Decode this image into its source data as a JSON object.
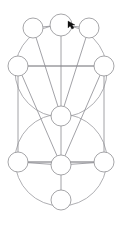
{
  "diagram": {
    "background_color": "#ffffff",
    "stroke_color": "#8a8a90",
    "node_fill": "#ffffff",
    "cursor_color": "#101010",
    "node_radius": 10,
    "nodes": [
      {
        "id": "n1",
        "label": "",
        "name": "node-top-left",
        "cx": 33,
        "cy": 28
      },
      {
        "id": "n2",
        "label": "",
        "name": "node-top-center",
        "cx": 61,
        "cy": 25
      },
      {
        "id": "n3",
        "label": "",
        "name": "node-top-right",
        "cx": 89,
        "cy": 28
      },
      {
        "id": "n4",
        "label": "",
        "name": "node-upper-left",
        "cx": 18,
        "cy": 66
      },
      {
        "id": "n5",
        "label": "",
        "name": "node-upper-right",
        "cx": 104,
        "cy": 66
      },
      {
        "id": "n6",
        "label": "",
        "name": "node-center",
        "cx": 61,
        "cy": 116
      },
      {
        "id": "n7",
        "label": "",
        "name": "node-lower-left",
        "cx": 18,
        "cy": 162
      },
      {
        "id": "n8",
        "label": "",
        "name": "node-lower-center",
        "cx": 61,
        "cy": 165
      },
      {
        "id": "n9",
        "label": "",
        "name": "node-lower-right",
        "cx": 104,
        "cy": 162
      },
      {
        "id": "n10",
        "label": "",
        "name": "node-bottom",
        "cx": 61,
        "cy": 200
      }
    ],
    "edges": [
      {
        "from": "n6",
        "to": "n1",
        "name": "edge-center-topleft"
      },
      {
        "from": "n6",
        "to": "n2",
        "name": "edge-center-topcenter"
      },
      {
        "from": "n6",
        "to": "n3",
        "name": "edge-center-topright"
      },
      {
        "from": "n1",
        "to": "n2",
        "name": "edge-topleft-topcenter"
      },
      {
        "from": "n2",
        "to": "n3",
        "name": "edge-topcenter-topright"
      },
      {
        "from": "n4",
        "to": "n5",
        "name": "edge-upperleft-upperright"
      },
      {
        "from": "n4",
        "to": "n7",
        "name": "edge-upperleft-lowerleft"
      },
      {
        "from": "n5",
        "to": "n9",
        "name": "edge-upperright-lowerright"
      },
      {
        "from": "n6",
        "to": "n8",
        "name": "edge-center-lowercenter"
      },
      {
        "from": "n7",
        "to": "n8",
        "name": "edge-lowerleft-lowercenter"
      },
      {
        "from": "n8",
        "to": "n9",
        "name": "edge-lowercenter-lowerright"
      },
      {
        "from": "n7",
        "to": "n9",
        "name": "edge-lowerleft-lowerright"
      },
      {
        "from": "n8",
        "to": "n10",
        "name": "edge-lowercenter-bottom"
      },
      {
        "from": "n5",
        "to": "n8",
        "name": "edge-upperright-lowercenter"
      },
      {
        "from": "n4",
        "to": "n8",
        "name": "edge-upperleft-lowercenter"
      }
    ],
    "big_circles": [
      {
        "name": "upper-great-circle",
        "cx": 61,
        "cy": 71,
        "r": 46
      },
      {
        "name": "lower-great-circle",
        "cx": 61,
        "cy": 160,
        "r": 46
      }
    ],
    "frame": {
      "name": "bounding-rectangle",
      "x": 18,
      "y": 66,
      "width": 86,
      "height": 96
    },
    "cursor": {
      "name": "mouse-cursor",
      "x": 68,
      "y": 21,
      "shape": "arrow-pointer"
    }
  }
}
